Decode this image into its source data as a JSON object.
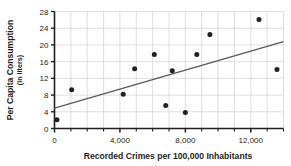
{
  "chart_data": {
    "type": "scatter",
    "title": "",
    "xlabel": "Recorded Crimes per 100,000 Inhabitants",
    "ylabel": "Per Capita Consumption",
    "ylabel_sub": "(in liters)",
    "xlim": [
      0,
      14000
    ],
    "ylim": [
      0,
      28
    ],
    "xticks": [
      0,
      4000,
      8000,
      12000
    ],
    "xtick_labels": [
      "0",
      "4,000",
      "8,000",
      "12,000"
    ],
    "xminor_step": 1000,
    "yticks": [
      0,
      4,
      8,
      12,
      16,
      20,
      24,
      28
    ],
    "ytick_labels": [
      "0",
      "4",
      "8",
      "12",
      "16",
      "20",
      "24",
      "28"
    ],
    "grid": true,
    "grid_color": "#c9c9c9",
    "axis_color": "#231f20",
    "point_color": "#231f20",
    "line_color": "#58595b",
    "legend": "none",
    "points": [
      {
        "x": 150,
        "y": 2.1
      },
      {
        "x": 1050,
        "y": 9.3
      },
      {
        "x": 4200,
        "y": 8.2
      },
      {
        "x": 4900,
        "y": 14.3
      },
      {
        "x": 6100,
        "y": 17.7
      },
      {
        "x": 6800,
        "y": 5.5
      },
      {
        "x": 7200,
        "y": 13.8
      },
      {
        "x": 8000,
        "y": 3.8
      },
      {
        "x": 8700,
        "y": 17.7
      },
      {
        "x": 9500,
        "y": 22.5
      },
      {
        "x": 12500,
        "y": 26.1
      },
      {
        "x": 13600,
        "y": 14.1
      }
    ],
    "trend_line": {
      "label": "trend-line",
      "x0": 0,
      "y0": 4.9,
      "x1": 14000,
      "y1": 20.8
    }
  }
}
